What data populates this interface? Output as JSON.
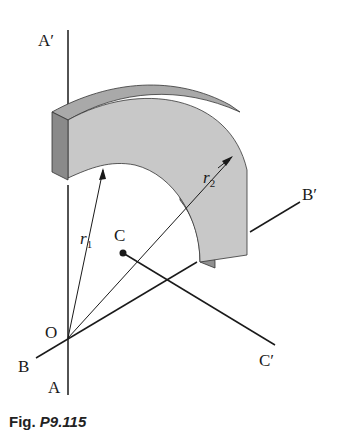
{
  "figure": {
    "caption_prefix": "Fig.",
    "caption_number": "P9.115",
    "labels": {
      "A_prime": "A′",
      "A": "A",
      "B_prime": "B′",
      "B": "B",
      "C": "C",
      "C_prime": "C′",
      "O": "O",
      "r1": "r",
      "r1_sub": "1",
      "r2": "r",
      "r2_sub": "2"
    },
    "colors": {
      "line": "#1a1a1a",
      "front_face": "#c8c8c8",
      "top_face": "#a9a9a9",
      "side_face": "#8a8a8a",
      "inner_face": "#909090"
    }
  }
}
